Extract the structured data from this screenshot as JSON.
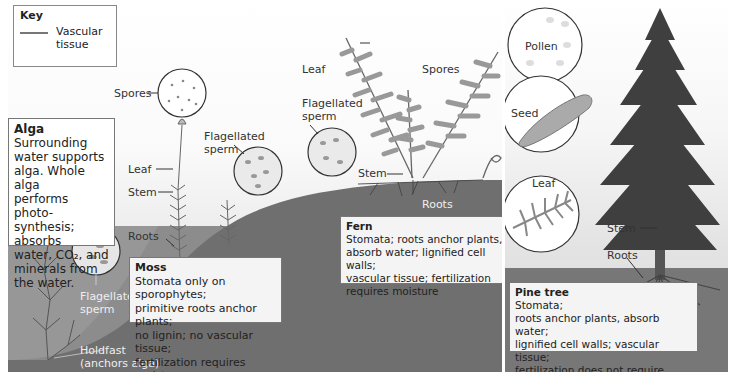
{
  "key": {
    "title": "Key",
    "item_label_line1": "Vascular",
    "item_label_line2": "tissue",
    "item_color": "#777777"
  },
  "alga": {
    "box_title": "Alga",
    "box_lines": [
      "Surrounding",
      "water supports",
      "alga. Whole alga",
      "performs photo-",
      "synthesis; absorbs",
      "water, CO₂, and",
      "minerals from",
      "the water."
    ],
    "labels": {
      "flagellated_sperm_1": "Flagellated",
      "flagellated_sperm_2": "sperm",
      "holdfast_1": "Holdfast",
      "holdfast_2": "(anchors alga)"
    }
  },
  "moss": {
    "box_title": "Moss",
    "box_lines": [
      "Stomata only on sporophytes;",
      "primitive roots anchor plants;",
      "no lignin;  no vascular tissue;",
      "fertilization requires moisture"
    ],
    "labels": {
      "spores": "Spores",
      "leaf": "Leaf",
      "stem": "Stem",
      "roots": "Roots",
      "flagellated_sperm_1": "Flagellated",
      "flagellated_sperm_2": "sperm"
    }
  },
  "fern": {
    "box_title": "Fern",
    "box_lines": [
      "Stomata;  roots anchor plants,",
      "absorb water;  lignified cell walls;",
      "vascular tissue;  fertilization",
      "requires moisture"
    ],
    "labels": {
      "leaf": "Leaf",
      "spores": "Spores",
      "stem": "Stem",
      "roots": "Roots",
      "flagellated_sperm_1": "Flagellated",
      "flagellated_sperm_2": "sperm"
    }
  },
  "pine": {
    "box_title": "Pine tree",
    "box_lines": [
      "Stomata;",
      "roots anchor plants, absorb water;",
      "lignified cell walls;  vascular tissue;",
      "fertilization does not require moisture"
    ],
    "labels": {
      "pollen": "Pollen",
      "seed": "Seed",
      "leaf": "Leaf",
      "stem": "Stem",
      "roots": "Roots"
    }
  },
  "colors": {
    "ground": "#6e6e6e",
    "water": "#8a8a8a",
    "plant": "#7a7a7a",
    "box_bg": "#f4f4f4",
    "border": "#777777"
  }
}
